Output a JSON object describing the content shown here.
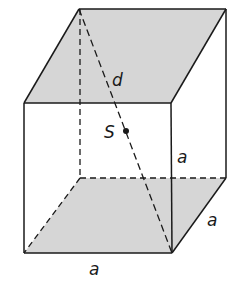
{
  "diagram": {
    "type": "cuboid-space-diagonal",
    "shade_color": "#d6d6d6",
    "line_color": "#1a1a1a",
    "labels": {
      "diagonal": "d",
      "center": "S",
      "height_edge": "a",
      "depth_edge": "a",
      "width_edge": "a"
    },
    "vertices": {
      "back_top_left": [
        79,
        9
      ],
      "back_top_right": [
        226,
        9
      ],
      "front_top_left": [
        24,
        103
      ],
      "front_top_right": [
        171,
        103
      ],
      "front_bottom_left": [
        24,
        253
      ],
      "front_bottom_right": [
        172,
        253
      ],
      "back_bottom_left": [
        80,
        178
      ],
      "back_bottom_right": [
        226,
        178
      ]
    },
    "shaded_faces": [
      "top",
      "bottom"
    ],
    "hidden_edges": [
      "back_bottom_left-back_top_left",
      "back_bottom_left-back_bottom_right",
      "back_bottom_left-front_bottom_left"
    ],
    "diagonal_from": "back_top_left",
    "diagonal_to": "front_bottom_right"
  }
}
